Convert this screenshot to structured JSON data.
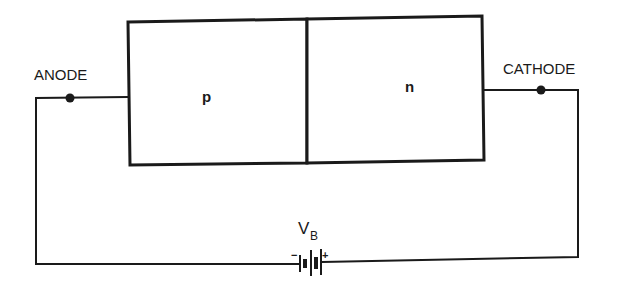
{
  "diagram": {
    "type": "pn-junction-circuit",
    "terminals": {
      "anode": "ANODE",
      "cathode": "CATHODE"
    },
    "regions": {
      "p": "p",
      "n": "n"
    },
    "battery": {
      "label_main": "V",
      "label_sub": "B",
      "negative": "−",
      "positive": "+"
    },
    "colors": {
      "line": "#1a1a1a",
      "background": "#ffffff"
    }
  }
}
